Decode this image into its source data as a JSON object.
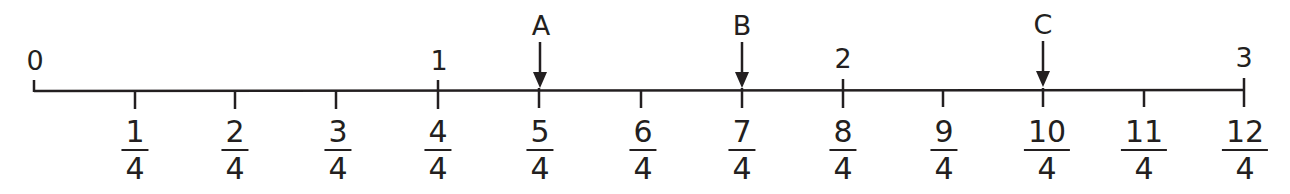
{
  "diagram": {
    "type": "number-line",
    "range": [
      0,
      3
    ],
    "whole_labels": [
      {
        "value": 0,
        "label": "0"
      },
      {
        "value": 1,
        "label": "1"
      },
      {
        "value": 2,
        "label": "2"
      },
      {
        "value": 3,
        "label": "3"
      }
    ],
    "fraction_labels": [
      {
        "numerator": "1",
        "denominator": "4"
      },
      {
        "numerator": "2",
        "denominator": "4"
      },
      {
        "numerator": "3",
        "denominator": "4"
      },
      {
        "numerator": "4",
        "denominator": "4"
      },
      {
        "numerator": "5",
        "denominator": "4"
      },
      {
        "numerator": "6",
        "denominator": "4"
      },
      {
        "numerator": "7",
        "denominator": "4"
      },
      {
        "numerator": "8",
        "denominator": "4"
      },
      {
        "numerator": "9",
        "denominator": "4"
      },
      {
        "numerator": "10",
        "denominator": "4"
      },
      {
        "numerator": "11",
        "denominator": "4"
      },
      {
        "numerator": "12",
        "denominator": "4"
      }
    ],
    "markers": [
      {
        "label": "A",
        "at_quarter": 5
      },
      {
        "label": "B",
        "at_quarter": 7
      },
      {
        "label": "C",
        "at_quarter": 10
      }
    ],
    "line_color": "#231f20"
  }
}
